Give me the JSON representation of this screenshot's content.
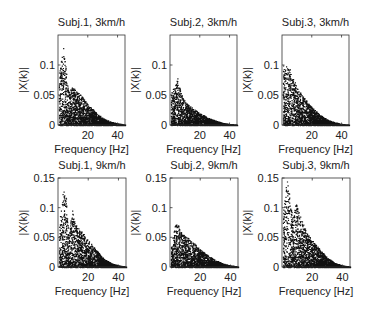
{
  "figure": {
    "width": 368,
    "height": 314,
    "background": "#ffffff",
    "point_color": "#111111",
    "axis_color": "#333333"
  },
  "chart_data": [
    {
      "type": "scatter",
      "title": "Subj.1, 3km/h",
      "xlabel": "Frequency [Hz]",
      "ylabel": "|X(k)|",
      "xlim": [
        0,
        45
      ],
      "ylim": [
        0,
        0.15
      ],
      "xticks": [
        20,
        40
      ],
      "yticks": [
        0,
        0.05,
        0.1
      ],
      "ytick_labels": [
        "0",
        "0.05",
        "0.1"
      ],
      "grid": false,
      "envelope": {
        "f": [
          1,
          3,
          5,
          7,
          9,
          12,
          16,
          20,
          25,
          30,
          35,
          40,
          45
        ],
        "max": [
          0.09,
          0.14,
          0.1,
          0.055,
          0.065,
          0.058,
          0.048,
          0.035,
          0.022,
          0.012,
          0.006,
          0.003,
          0.001
        ]
      }
    },
    {
      "type": "scatter",
      "title": "Subj.2, 3km/h",
      "xlabel": "Frequency [Hz]",
      "ylabel": "|X(k)|",
      "xlim": [
        0,
        45
      ],
      "ylim": [
        0,
        0.15
      ],
      "xticks": [
        20,
        40
      ],
      "yticks": [
        0,
        0.05,
        0.1
      ],
      "ytick_labels": [
        "0",
        "0.05",
        "0.1"
      ],
      "grid": false,
      "envelope": {
        "f": [
          1,
          3,
          5,
          7,
          9,
          12,
          16,
          20,
          25,
          30,
          35,
          40,
          45
        ],
        "max": [
          0.06,
          0.065,
          0.08,
          0.055,
          0.045,
          0.035,
          0.027,
          0.02,
          0.013,
          0.008,
          0.004,
          0.002,
          0.001
        ]
      }
    },
    {
      "type": "scatter",
      "title": "Subj.3, 3km/h",
      "xlabel": "Frequency [Hz]",
      "ylabel": "|X(k)|",
      "xlim": [
        0,
        45
      ],
      "ylim": [
        0,
        0.15
      ],
      "xticks": [
        20,
        40
      ],
      "yticks": [
        0,
        0.05,
        0.1
      ],
      "ytick_labels": [
        "0",
        "0.05",
        "0.1"
      ],
      "grid": false,
      "envelope": {
        "f": [
          1,
          3,
          5,
          7,
          9,
          12,
          16,
          20,
          25,
          30,
          35,
          40,
          45
        ],
        "max": [
          0.1,
          0.1,
          0.095,
          0.08,
          0.07,
          0.055,
          0.042,
          0.03,
          0.018,
          0.01,
          0.005,
          0.002,
          0.001
        ]
      }
    },
    {
      "type": "scatter",
      "title": "Subj.1, 9km/h",
      "xlabel": "Frequency [Hz]",
      "ylabel": "|X(k)|",
      "xlim": [
        0,
        45
      ],
      "ylim": [
        0,
        0.15
      ],
      "xticks": [
        20,
        40
      ],
      "yticks": [
        0,
        0.05,
        0.1,
        0.15
      ],
      "ytick_labels": [
        "0",
        "0.05",
        "0.1",
        "0.15"
      ],
      "grid": false,
      "envelope": {
        "f": [
          1,
          3,
          5,
          7,
          9,
          12,
          16,
          20,
          25,
          30,
          35,
          40,
          45
        ],
        "max": [
          0.08,
          0.13,
          0.125,
          0.05,
          0.1,
          0.07,
          0.06,
          0.045,
          0.03,
          0.015,
          0.007,
          0.003,
          0.001
        ]
      }
    },
    {
      "type": "scatter",
      "title": "Subj.2, 9km/h",
      "xlabel": "Frequency [Hz]",
      "ylabel": "|X(k)|",
      "xlim": [
        0,
        45
      ],
      "ylim": [
        0,
        0.15
      ],
      "xticks": [
        20,
        40
      ],
      "yticks": [
        0,
        0.05,
        0.1,
        0.15
      ],
      "ytick_labels": [
        "0",
        "0.05",
        "0.1",
        "0.15"
      ],
      "grid": false,
      "envelope": {
        "f": [
          1,
          3,
          5,
          7,
          9,
          12,
          16,
          20,
          25,
          30,
          35,
          40,
          45
        ],
        "max": [
          0.04,
          0.07,
          0.075,
          0.06,
          0.055,
          0.05,
          0.04,
          0.03,
          0.02,
          0.012,
          0.006,
          0.003,
          0.001
        ]
      }
    },
    {
      "type": "scatter",
      "title": "Subj.3, 9km/h",
      "xlabel": "Frequency [Hz]",
      "ylabel": "|X(k)|",
      "xlim": [
        0,
        45
      ],
      "ylim": [
        0,
        0.15
      ],
      "xticks": [
        20,
        40
      ],
      "yticks": [
        0,
        0.05,
        0.1,
        0.15
      ],
      "ytick_labels": [
        "0",
        "0.05",
        "0.1",
        "0.15"
      ],
      "grid": false,
      "envelope": {
        "f": [
          1,
          3,
          5,
          7,
          9,
          12,
          16,
          20,
          25,
          30,
          35,
          40,
          45
        ],
        "max": [
          0.1,
          0.15,
          0.12,
          0.08,
          0.11,
          0.085,
          0.06,
          0.045,
          0.03,
          0.016,
          0.007,
          0.003,
          0.001
        ]
      }
    }
  ],
  "layout": {
    "panels": [
      {
        "left": 58,
        "top": 35,
        "width": 67,
        "height": 90
      },
      {
        "left": 170,
        "top": 35,
        "width": 67,
        "height": 90
      },
      {
        "left": 282,
        "top": 35,
        "width": 67,
        "height": 90
      },
      {
        "left": 58,
        "top": 178,
        "width": 68,
        "height": 89
      },
      {
        "left": 170,
        "top": 178,
        "width": 68,
        "height": 89
      },
      {
        "left": 282,
        "top": 178,
        "width": 68,
        "height": 89
      }
    ]
  }
}
